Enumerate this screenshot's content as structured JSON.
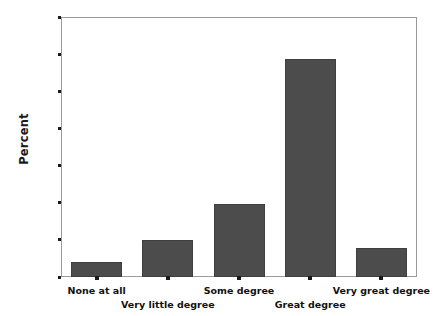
{
  "chart_data": {
    "type": "bar",
    "title": "",
    "subtitle": "",
    "xlabel": "",
    "ylabel": "Percent",
    "categories": [
      "None at all",
      "Very little degree",
      "Some degree",
      "Great degree",
      "Very great degree"
    ],
    "values": [
      4,
      10,
      19.7,
      58.7,
      7.8
    ],
    "series": [
      {
        "name": "Percent",
        "values": [
          4,
          10,
          19.7,
          58.7,
          7.8
        ]
      }
    ],
    "ylim": [
      0,
      70
    ],
    "ytick_values": [
      0,
      10,
      20,
      30,
      40,
      50,
      60,
      70
    ],
    "ytick_labels": [
      "0",
      "10",
      "20",
      "30",
      "40",
      "50",
      "60",
      "70"
    ],
    "grid": false,
    "legend": false,
    "legend_position": "none",
    "bar_color": "#4c4c4c",
    "bar_edge_color": "#3f3f3f",
    "axis_color": "#9a9a9a",
    "text_color": "#111111",
    "background_color": "#ffffff",
    "xtick_label_rows": [
      0,
      1,
      0,
      1,
      0
    ],
    "annotations": []
  }
}
